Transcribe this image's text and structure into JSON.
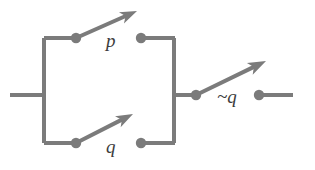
{
  "diagram": {
    "type": "switch-circuit",
    "canvas": {
      "width": 315,
      "height": 170
    },
    "colors": {
      "background": "#ffffff",
      "wire": "#7b7b7b",
      "wire_dark": "#6f6f6f",
      "label": "#3c3c3c"
    },
    "stroke": {
      "rail_width": 4,
      "arm_width": 4,
      "lead_width": 4,
      "node_radius": 5.2
    },
    "labels": [
      {
        "id": "label-p",
        "text": "p",
        "x": 106,
        "y": 47,
        "size": 19
      },
      {
        "id": "label-q",
        "text": "q",
        "x": 106,
        "y": 153,
        "size": 19
      },
      {
        "id": "label-nq",
        "text": "~q",
        "x": 217,
        "y": 103,
        "size": 19
      }
    ],
    "nodes": [
      {
        "id": "node-p-left",
        "name": "switch-node-p-left",
        "x": 76,
        "y": 38
      },
      {
        "id": "node-p-right",
        "name": "switch-node-p-right",
        "x": 141,
        "y": 38
      },
      {
        "id": "node-q-left",
        "name": "switch-node-q-left",
        "x": 76,
        "y": 143
      },
      {
        "id": "node-q-right",
        "name": "switch-node-q-right",
        "x": 141,
        "y": 143
      },
      {
        "id": "node-nq-left",
        "name": "switch-node-notq-left",
        "x": 196,
        "y": 95
      },
      {
        "id": "node-nq-right",
        "name": "switch-node-notq-right",
        "x": 259,
        "y": 95
      }
    ],
    "rails": [
      {
        "id": "rail-left",
        "name": "left-vertical-rail",
        "x1": 44,
        "y1": 38,
        "x2": 44,
        "y2": 143
      },
      {
        "id": "rail-right",
        "name": "right-vertical-rail",
        "x1": 174,
        "y1": 38,
        "x2": 174,
        "y2": 143
      },
      {
        "id": "rail-top",
        "name": "top-branch-wire",
        "x1": 44,
        "y1": 38,
        "x2": 77,
        "y2": 38
      },
      {
        "id": "rail-bottom",
        "name": "bottom-branch-wire",
        "x1": 44,
        "y1": 143,
        "x2": 77,
        "y2": 143
      },
      {
        "id": "rail-top-right",
        "name": "top-right-wire",
        "x1": 140,
        "y1": 38,
        "x2": 175,
        "y2": 38
      },
      {
        "id": "rail-bottom-right",
        "name": "bottom-right-wire",
        "x1": 140,
        "y1": 143,
        "x2": 175,
        "y2": 143
      },
      {
        "id": "lead-in",
        "name": "input-lead-wire",
        "x1": 10,
        "y1": 95,
        "x2": 45,
        "y2": 95
      },
      {
        "id": "lead-mid",
        "name": "output-tap-wire",
        "x1": 173,
        "y1": 95,
        "x2": 197,
        "y2": 95
      },
      {
        "id": "lead-out",
        "name": "output-lead-wire",
        "x1": 259,
        "y1": 95,
        "x2": 293,
        "y2": 95
      }
    ],
    "switches": [
      {
        "id": "switch-p",
        "name": "open-switch-p",
        "state": "open",
        "pivot_x": 76,
        "pivot_y": 38,
        "tip_x": 137,
        "tip_y": 11,
        "head_len": 17,
        "head_halfwidth": 6.2
      },
      {
        "id": "switch-q",
        "name": "open-switch-q",
        "state": "open",
        "pivot_x": 76,
        "pivot_y": 143,
        "tip_x": 133,
        "tip_y": 114,
        "head_len": 17,
        "head_halfwidth": 6.2
      },
      {
        "id": "switch-nq",
        "name": "open-switch-not-q",
        "state": "open",
        "pivot_x": 196,
        "pivot_y": 95,
        "tip_x": 266,
        "tip_y": 61,
        "head_len": 18,
        "head_halfwidth": 6.6
      }
    ]
  }
}
